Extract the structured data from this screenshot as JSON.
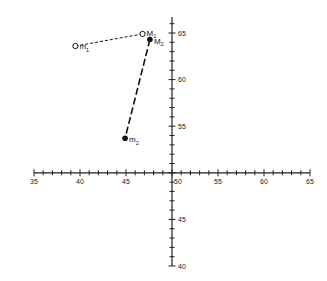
{
  "chart_data": {
    "type": "scatter",
    "title": "",
    "xlabel": "",
    "ylabel": "",
    "xlim": [
      35,
      65
    ],
    "ylim": [
      40,
      65
    ],
    "x_ticks": [
      "35",
      "40",
      "45",
      "50",
      "55",
      "60",
      "65"
    ],
    "y_ticks": [
      "40",
      "45",
      "50",
      "55",
      "60",
      "65"
    ],
    "axes_cross_at": {
      "x": 50,
      "y": 50
    },
    "grid": false,
    "points": [
      {
        "name": "m1",
        "label": "m",
        "sub": "1",
        "x": 39.5,
        "y": 63.6,
        "marker": "open"
      },
      {
        "name": "M1",
        "label": "M",
        "sub": "1",
        "x": 46.8,
        "y": 64.9,
        "marker": "open"
      },
      {
        "name": "M2",
        "label": "M",
        "sub": "2",
        "x": 47.6,
        "y": 64.3,
        "marker": "filled"
      },
      {
        "name": "m2",
        "label": "m",
        "sub": "2",
        "x": 44.9,
        "y": 53.7,
        "marker": "filled"
      }
    ],
    "connections": [
      {
        "from": "m1",
        "to": "M1",
        "style": "short-dash"
      },
      {
        "from": "M2",
        "to": "m2",
        "style": "long-dash"
      }
    ]
  }
}
